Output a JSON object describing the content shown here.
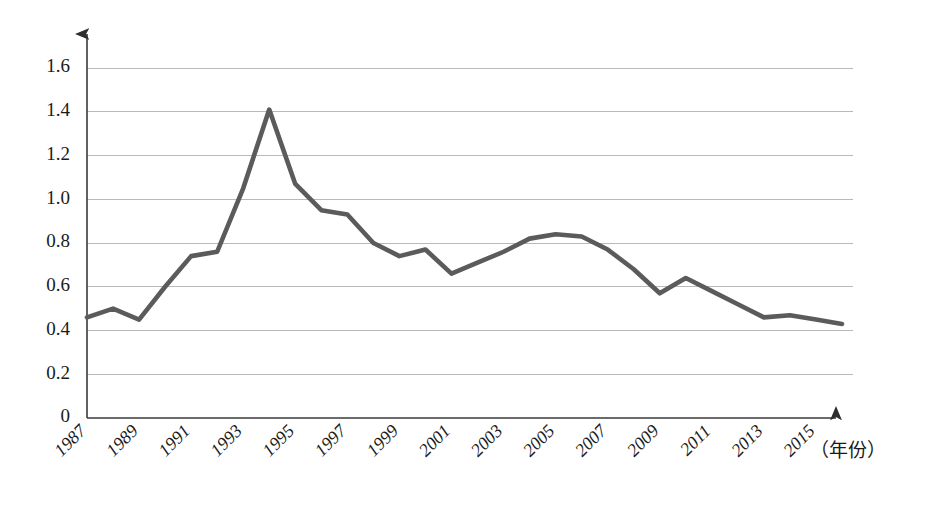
{
  "chart_data": {
    "type": "line",
    "title": "",
    "subtitle": "",
    "xlabel": "（年份）",
    "ylabel": "",
    "grid": true,
    "legend": "none",
    "xlim": [
      1987,
      2016
    ],
    "ylim": [
      0,
      1.7
    ],
    "y_ticks": [
      "0",
      "0.2",
      "0.4",
      "0.6",
      "0.8",
      "1.0",
      "1.2",
      "1.4",
      "1.6"
    ],
    "y_tick_values": [
      0,
      0.2,
      0.4,
      0.6,
      0.8,
      1.0,
      1.2,
      1.4,
      1.6
    ],
    "x_ticks": [
      "1987",
      "1989",
      "1991",
      "1993",
      "1995",
      "1997",
      "1999",
      "2001",
      "2003",
      "2005",
      "2007",
      "2009",
      "2011",
      "2013",
      "2015"
    ],
    "x_tick_values": [
      1987,
      1989,
      1991,
      1993,
      1995,
      1997,
      1999,
      2001,
      2003,
      2005,
      2007,
      2009,
      2011,
      2013,
      2015
    ],
    "x": [
      1987,
      1988,
      1989,
      1990,
      1991,
      1992,
      1993,
      1994,
      1995,
      1996,
      1997,
      1998,
      1999,
      2000,
      2001,
      2002,
      2003,
      2004,
      2005,
      2006,
      2007,
      2008,
      2009,
      2010,
      2011,
      2012,
      2013,
      2014,
      2015,
      2016
    ],
    "values": [
      0.46,
      0.5,
      0.45,
      0.6,
      0.74,
      0.76,
      1.05,
      1.41,
      1.07,
      0.95,
      0.93,
      0.8,
      0.74,
      0.77,
      0.66,
      0.71,
      0.76,
      0.82,
      0.84,
      0.83,
      0.77,
      0.68,
      0.57,
      0.64,
      0.58,
      0.52,
      0.46,
      0.47,
      0.45,
      0.43
    ],
    "series": [
      {
        "name": "",
        "color": "#5b5b5b",
        "values": [
          0.46,
          0.5,
          0.45,
          0.6,
          0.74,
          0.76,
          1.05,
          1.41,
          1.07,
          0.95,
          0.93,
          0.8,
          0.74,
          0.77,
          0.66,
          0.71,
          0.76,
          0.82,
          0.84,
          0.83,
          0.77,
          0.68,
          0.57,
          0.64,
          0.58,
          0.52,
          0.46,
          0.47,
          0.45,
          0.43
        ]
      }
    ],
    "annotations": []
  },
  "colors": {
    "line": "#5b5b5b",
    "grid": "#b9b9b9",
    "axis": "#3a3a3a",
    "text": "#1a1a1a",
    "background": "#ffffff"
  }
}
